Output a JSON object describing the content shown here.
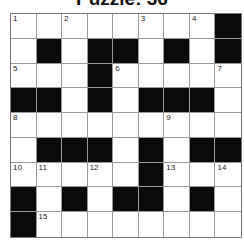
{
  "title": "Puzzle: 36",
  "grid": {
    "rows": 9,
    "cols": 9,
    "colors": {
      "black": "#0a0a0a",
      "white": "#ffffff",
      "line": "#999999"
    },
    "layout": [
      "WWWWWWWWB",
      "WBWBBWBWB",
      "WWWBWWWWW",
      "BBWBWBBBW",
      "WWWWWWWWW",
      "WBBBWBWBB",
      "WWWWWBWWW",
      "BWBWBBWBW",
      "BWWWWWWWW"
    ],
    "numbers": [
      {
        "r": 0,
        "c": 0,
        "n": "1"
      },
      {
        "r": 0,
        "c": 2,
        "n": "2"
      },
      {
        "r": 0,
        "c": 5,
        "n": "3"
      },
      {
        "r": 0,
        "c": 7,
        "n": "4"
      },
      {
        "r": 2,
        "c": 0,
        "n": "5"
      },
      {
        "r": 2,
        "c": 4,
        "n": "6"
      },
      {
        "r": 2,
        "c": 8,
        "n": "7"
      },
      {
        "r": 4,
        "c": 0,
        "n": "8"
      },
      {
        "r": 4,
        "c": 6,
        "n": "9"
      },
      {
        "r": 6,
        "c": 0,
        "n": "10"
      },
      {
        "r": 6,
        "c": 1,
        "n": "11"
      },
      {
        "r": 6,
        "c": 3,
        "n": "12"
      },
      {
        "r": 6,
        "c": 6,
        "n": "13"
      },
      {
        "r": 6,
        "c": 8,
        "n": "14"
      },
      {
        "r": 8,
        "c": 1,
        "n": "15"
      }
    ]
  }
}
